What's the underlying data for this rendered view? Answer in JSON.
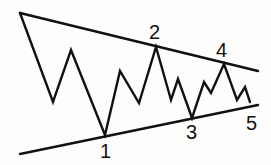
{
  "diagram": {
    "type": "symmetrical-triangle-wave-pattern",
    "colors": {
      "line": "#111111",
      "background": "#fdfdfb"
    },
    "upper_trendline": {
      "from": [
        20,
        13
      ],
      "to": [
        258,
        71
      ]
    },
    "lower_trendline": {
      "from": [
        20,
        154
      ],
      "to": [
        258,
        105
      ]
    },
    "price_path": [
      [
        20,
        13
      ],
      [
        53,
        102
      ],
      [
        71,
        50
      ],
      [
        105,
        135
      ],
      [
        120,
        71
      ],
      [
        139,
        103
      ],
      [
        156,
        47
      ],
      [
        171,
        100
      ],
      [
        178,
        79
      ],
      [
        192,
        118
      ],
      [
        204,
        82
      ],
      [
        211,
        93
      ],
      [
        224,
        64
      ],
      [
        237,
        100
      ],
      [
        245,
        87
      ],
      [
        250,
        102
      ]
    ],
    "labels": [
      {
        "text": "1",
        "x": 100,
        "y": 158
      },
      {
        "text": "2",
        "x": 149,
        "y": 39
      },
      {
        "text": "3",
        "x": 186,
        "y": 139
      },
      {
        "text": "4",
        "x": 216,
        "y": 57
      },
      {
        "text": "5",
        "x": 246,
        "y": 130
      }
    ]
  }
}
